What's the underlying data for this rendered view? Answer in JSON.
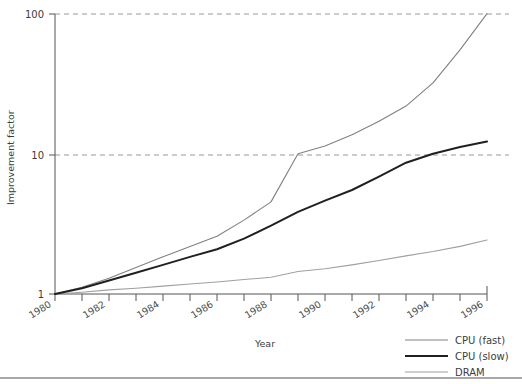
{
  "chart_data": {
    "type": "line",
    "title": "",
    "xlabel": "Year",
    "ylabel": "Improvement factor",
    "yscale": "log",
    "ylim": [
      1,
      110
    ],
    "xlim": [
      1980,
      1996.4
    ],
    "yticks": [
      1,
      10,
      100
    ],
    "ytick_labels": [
      "1",
      "10",
      "100"
    ],
    "grid": "horizontal-dashed-at-yticks",
    "minor_xticks_every": 1,
    "xticks": [
      1980,
      1982,
      1984,
      1986,
      1988,
      1990,
      1992,
      1994,
      1996
    ],
    "xtick_labels": [
      "1980",
      "1982",
      "1984",
      "1986",
      "1988",
      "1990",
      "1992",
      "1994",
      "1996"
    ],
    "xtick_label_rotation_deg": 32,
    "legend_position": "bottom-right-outside",
    "x": [
      1980,
      1981,
      1982,
      1983,
      1984,
      1985,
      1986,
      1987,
      1988,
      1989,
      1990,
      1991,
      1992,
      1993,
      1994,
      1995,
      1996
    ],
    "series": [
      {
        "name": "CPU (fast)",
        "color": "#808080",
        "width": 1.1,
        "values": [
          1.0,
          1.12,
          1.3,
          1.55,
          1.85,
          2.2,
          2.6,
          3.4,
          4.6,
          10.2,
          11.6,
          14.0,
          17.5,
          22.5,
          33.0,
          57.0,
          104.0
        ]
      },
      {
        "name": "CPU (slow)",
        "color": "#202020",
        "width": 2.0,
        "values": [
          1.0,
          1.1,
          1.25,
          1.42,
          1.62,
          1.85,
          2.1,
          2.5,
          3.1,
          3.9,
          4.7,
          5.6,
          7.0,
          8.8,
          10.2,
          11.4,
          12.5
        ]
      },
      {
        "name": "DRAM",
        "color": "#a0a0a0",
        "width": 1.1,
        "values": [
          1.0,
          1.03,
          1.07,
          1.1,
          1.14,
          1.18,
          1.22,
          1.27,
          1.32,
          1.45,
          1.52,
          1.62,
          1.74,
          1.88,
          2.02,
          2.2,
          2.45
        ]
      }
    ]
  },
  "axes": {
    "y_title": "Improvement factor",
    "x_title": "Year",
    "y_labels": [
      "100",
      "10",
      "1"
    ],
    "x_labels": [
      "1980",
      "1982",
      "1984",
      "1986",
      "1988",
      "1990",
      "1992",
      "1994",
      "1996"
    ]
  },
  "legend": {
    "entries": [
      {
        "label": "CPU (fast)"
      },
      {
        "label": "CPU (slow)"
      },
      {
        "label": "DRAM"
      }
    ]
  },
  "colors": {
    "cpu_fast": "#808080",
    "cpu_slow": "#202020",
    "dram": "#a0a0a0",
    "axis": "#555555",
    "grid": "#999999",
    "footer_rule": "#555555"
  }
}
